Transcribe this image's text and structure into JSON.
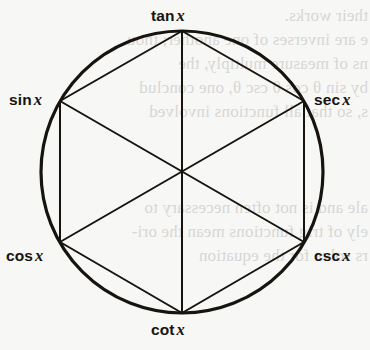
{
  "figure": {
    "background_color": "#f7f7f6",
    "ink_color": "#17140f",
    "circle": {
      "cx": 182,
      "cy": 172,
      "r": 141,
      "stroke_width": 3.2
    },
    "hexagon": {
      "stroke_width": 2.0,
      "vertices": [
        {
          "name": "tan",
          "label": "tan",
          "variable": "x",
          "x": 182,
          "y": 31,
          "angle_deg": 90
        },
        {
          "name": "sec",
          "label": "sec",
          "variable": "x",
          "x": 304,
          "y": 101,
          "angle_deg": 30
        },
        {
          "name": "csc",
          "label": "csc",
          "variable": "x",
          "x": 304,
          "y": 242,
          "angle_deg": 330
        },
        {
          "name": "cot",
          "label": "cot",
          "variable": "x",
          "x": 182,
          "y": 313,
          "angle_deg": 270
        },
        {
          "name": "cos",
          "label": "cos",
          "variable": "x",
          "x": 60,
          "y": 242,
          "angle_deg": 210
        },
        {
          "name": "sin",
          "label": "sin",
          "variable": "x",
          "x": 60,
          "y": 101,
          "angle_deg": 150
        }
      ],
      "edges": [
        [
          "tan",
          "sec"
        ],
        [
          "sec",
          "csc"
        ],
        [
          "csc",
          "cot"
        ],
        [
          "cot",
          "cos"
        ],
        [
          "cos",
          "sin"
        ],
        [
          "sin",
          "tan"
        ]
      ],
      "diagonals": [
        [
          "tan",
          "cot"
        ],
        [
          "sin",
          "csc"
        ],
        [
          "sec",
          "cos"
        ]
      ]
    },
    "labels": [
      {
        "key": "tan",
        "text": "tan",
        "variable": "x"
      },
      {
        "key": "sin",
        "text": "sin",
        "variable": "x"
      },
      {
        "key": "sec",
        "text": "sec",
        "variable": "x"
      },
      {
        "key": "cos",
        "text": "cos",
        "variable": "x"
      },
      {
        "key": "csc",
        "text": "csc",
        "variable": "x"
      },
      {
        "key": "cot",
        "text": "cot",
        "variable": "x"
      }
    ]
  },
  "ghost_text": {
    "note": "faint mirrored bleed-through from reverse of page",
    "lines": [
      {
        "text": "their works.",
        "x": 368,
        "y": 6
      },
      {
        "text": "e are inverses of one another; thou",
        "x": 368,
        "y": 30
      },
      {
        "text": "ns of measure multiply, the",
        "x": 368,
        "y": 54
      },
      {
        "text": "by sin θ cos θ csc θ, one conclud",
        "x": 368,
        "y": 78
      },
      {
        "text": "s, so that all functions involved",
        "x": 368,
        "y": 102
      },
      {
        "text": "ale and is not often necessary to",
        "x": 368,
        "y": 198
      },
      {
        "text": "ely of trig functions mean the ori-",
        "x": 368,
        "y": 222
      },
      {
        "text": "rs solve for the equation",
        "x": 368,
        "y": 246
      }
    ]
  }
}
